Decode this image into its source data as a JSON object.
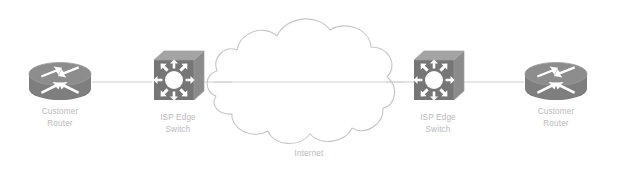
{
  "diagram": {
    "background_color": "#ffffff",
    "link_color": "#c9c9c9",
    "label_color": "#b9b9b9",
    "cloud_outline_color": "#c6c6c6",
    "device_fill_dark": "#7c7c7c",
    "device_fill_mid": "#8f8f8f",
    "device_fill_light": "#a6a6a6",
    "device_detail_color": "#ffffff"
  },
  "nodes": {
    "router_left": {
      "icon": "router-icon",
      "label_lines": [
        "Customer",
        "Router"
      ],
      "label_full": "Customer Router",
      "x": 60,
      "y": 82
    },
    "switch_left": {
      "icon": "switch-icon",
      "label_lines": [
        "ISP Edge",
        "Switch"
      ],
      "label_full": "ISP Edge Switch",
      "x": 178,
      "y": 82
    },
    "switch_right": {
      "icon": "switch-icon",
      "label_lines": [
        "ISP Edge",
        "Switch"
      ],
      "label_full": "ISP Edge Switch",
      "x": 438,
      "y": 82
    },
    "router_right": {
      "icon": "router-icon",
      "label_lines": [
        "Customer",
        "Router"
      ],
      "label_full": "Customer Router",
      "x": 556,
      "y": 82
    },
    "cloud": {
      "icon": "cloud-icon",
      "label_lines": [
        "Internet"
      ],
      "label_full": "Internet",
      "x": 309,
      "y": 82
    }
  },
  "links": [
    {
      "name": "link-router-left-to-switch-left",
      "from": "router_left",
      "to": "switch_left"
    },
    {
      "name": "link-switch-left-to-cloud",
      "from": "switch_left",
      "to": "cloud"
    },
    {
      "name": "link-cloud-to-switch-right",
      "from": "cloud",
      "to": "switch_right"
    },
    {
      "name": "link-switch-right-to-router-right",
      "from": "switch_right",
      "to": "router_right"
    }
  ]
}
